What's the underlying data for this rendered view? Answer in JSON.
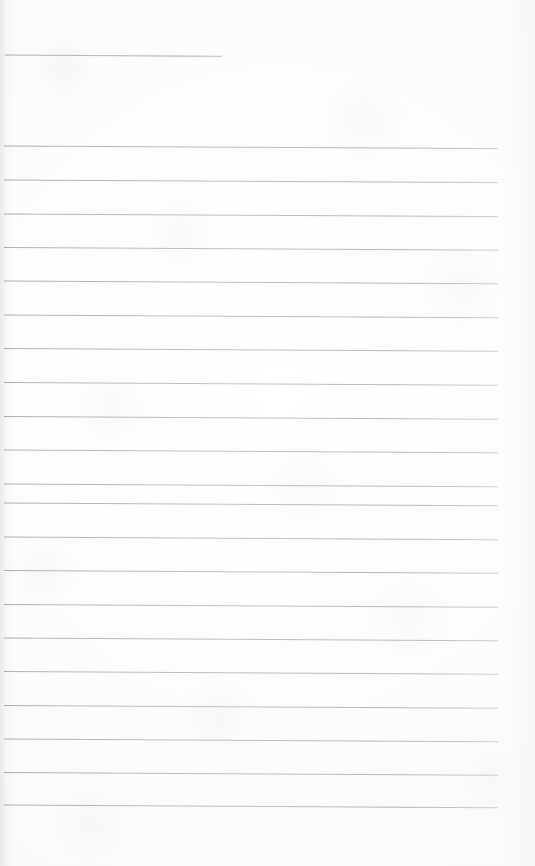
{
  "document": {
    "kind": "scanned-ruled-notebook-page",
    "title": "Blank lined page",
    "page_width": 535,
    "page_height": 866,
    "background_color": "#fcfcfc",
    "rule_color": "#a8aeb6",
    "rule_color_faint": "#c6cace",
    "rule_thickness": 1,
    "body_text": "",
    "handwriting": "",
    "margin_left": 5,
    "margin_right": 498,
    "line_spacing": 34,
    "line_count": 21
  },
  "ruled_lines": [
    {
      "id": "line-01",
      "x1": 5,
      "y1": 55.0,
      "x2": 222,
      "y2": 56.4,
      "opacity": 0.92,
      "width": 1.1
    },
    {
      "id": "line-02",
      "x1": 4,
      "y1": 146.0,
      "x2": 498,
      "y2": 148.6,
      "opacity": 0.9,
      "width": 1.0
    },
    {
      "id": "line-03",
      "x1": 4,
      "y1": 180.0,
      "x2": 498,
      "y2": 182.6,
      "opacity": 0.9,
      "width": 1.0
    },
    {
      "id": "line-04",
      "x1": 4,
      "y1": 214.0,
      "x2": 498,
      "y2": 216.6,
      "opacity": 0.88,
      "width": 1.0
    },
    {
      "id": "line-05",
      "x1": 4,
      "y1": 247.5,
      "x2": 498,
      "y2": 250.2,
      "opacity": 0.88,
      "width": 1.0
    },
    {
      "id": "line-06",
      "x1": 4,
      "y1": 281.0,
      "x2": 498,
      "y2": 283.8,
      "opacity": 0.9,
      "width": 1.0
    },
    {
      "id": "line-07",
      "x1": 4,
      "y1": 315.0,
      "x2": 498,
      "y2": 317.8,
      "opacity": 0.88,
      "width": 1.0
    },
    {
      "id": "line-08",
      "x1": 4,
      "y1": 348.5,
      "x2": 498,
      "y2": 351.3,
      "opacity": 0.88,
      "width": 1.0
    },
    {
      "id": "line-09",
      "x1": 4,
      "y1": 382.5,
      "x2": 498,
      "y2": 385.3,
      "opacity": 0.86,
      "width": 1.0
    },
    {
      "id": "line-10",
      "x1": 4,
      "y1": 416.5,
      "x2": 498,
      "y2": 419.3,
      "opacity": 0.88,
      "width": 1.0
    },
    {
      "id": "line-11",
      "x1": 4,
      "y1": 450.0,
      "x2": 498,
      "y2": 452.8,
      "opacity": 0.86,
      "width": 1.0
    },
    {
      "id": "line-12",
      "x1": 4,
      "y1": 484.0,
      "x2": 498,
      "y2": 486.8,
      "opacity": 0.88,
      "width": 1.0
    },
    {
      "id": "line-13",
      "x1": 4,
      "y1": 503.0,
      "x2": 498,
      "y2": 505.8,
      "opacity": 0.9,
      "width": 1.0
    },
    {
      "id": "line-14",
      "x1": 4,
      "y1": 537.0,
      "x2": 498,
      "y2": 539.8,
      "opacity": 0.88,
      "width": 1.0
    },
    {
      "id": "line-15",
      "x1": 4,
      "y1": 570.5,
      "x2": 498,
      "y2": 573.3,
      "opacity": 0.88,
      "width": 1.0
    },
    {
      "id": "line-16",
      "x1": 4,
      "y1": 604.5,
      "x2": 498,
      "y2": 607.3,
      "opacity": 0.86,
      "width": 1.0
    },
    {
      "id": "line-17",
      "x1": 4,
      "y1": 638.0,
      "x2": 498,
      "y2": 640.8,
      "opacity": 0.88,
      "width": 1.0
    },
    {
      "id": "line-18",
      "x1": 4,
      "y1": 671.5,
      "x2": 498,
      "y2": 674.3,
      "opacity": 0.86,
      "width": 1.0
    },
    {
      "id": "line-19",
      "x1": 4,
      "y1": 705.5,
      "x2": 498,
      "y2": 708.3,
      "opacity": 0.88,
      "width": 1.0
    },
    {
      "id": "line-20",
      "x1": 4,
      "y1": 739.0,
      "x2": 498,
      "y2": 741.8,
      "opacity": 0.88,
      "width": 1.0
    },
    {
      "id": "line-21",
      "x1": 4,
      "y1": 772.5,
      "x2": 498,
      "y2": 775.3,
      "opacity": 0.9,
      "width": 1.0
    },
    {
      "id": "line-22",
      "x1": 4,
      "y1": 805.0,
      "x2": 498,
      "y2": 807.8,
      "opacity": 0.9,
      "width": 1.0
    }
  ]
}
